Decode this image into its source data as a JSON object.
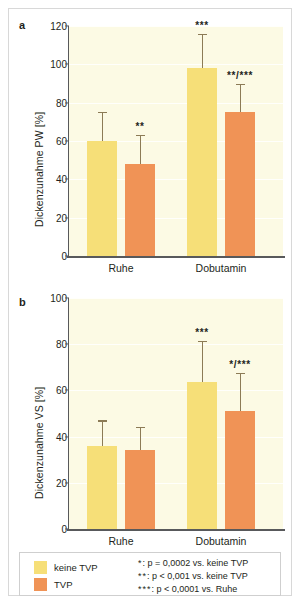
{
  "figure": {
    "panels": [
      {
        "letter": "a",
        "ylabel": "Dickenzunahme PW [%]",
        "yticks": [
          0,
          20,
          40,
          60,
          80,
          100,
          120
        ],
        "ylim": [
          0,
          120
        ],
        "categories": [
          "Ruhe",
          "Dobutamin"
        ]
      },
      {
        "letter": "b",
        "ylabel": "Dickenzunahme VS [%]",
        "yticks": [
          0,
          20,
          40,
          60,
          80,
          100
        ],
        "ylim": [
          0,
          100
        ],
        "categories": [
          "Ruhe",
          "Dobutamin"
        ]
      }
    ]
  },
  "legend": {
    "keys": [
      {
        "label": "keine TVP",
        "color": "#f6df78"
      },
      {
        "label": "TVP",
        "color": "#f09356"
      }
    ],
    "notes": [
      {
        "stars": "*",
        "text": ": p = 0,0002 vs. keine TVP"
      },
      {
        "stars": "**",
        "text": ": p < 0,001 vs. keine TVP"
      },
      {
        "stars": "***",
        "text": ": p < 0,0001 vs. Ruhe"
      }
    ]
  },
  "caption": "",
  "chart_data": [
    {
      "type": "bar",
      "panel": "a",
      "title": "",
      "xlabel": "",
      "ylabel": "Dickenzunahme PW [%]",
      "ylim": [
        0,
        120
      ],
      "yticks": [
        0,
        20,
        40,
        60,
        80,
        100,
        120
      ],
      "grid": true,
      "legend_position": "below",
      "categories": [
        "Ruhe",
        "Dobutamin"
      ],
      "series": [
        {
          "name": "keine TVP",
          "color": "#f6df78",
          "values": [
            60,
            98
          ],
          "errors_upper": [
            15,
            18
          ],
          "annotations": [
            "",
            "***"
          ]
        },
        {
          "name": "TVP",
          "color": "#f09356",
          "values": [
            48,
            75
          ],
          "errors_upper": [
            15,
            15
          ],
          "annotations": [
            "**",
            "**/***"
          ]
        }
      ]
    },
    {
      "type": "bar",
      "panel": "b",
      "title": "",
      "xlabel": "",
      "ylabel": "Dickenzunahme VS [%]",
      "ylim": [
        0,
        100
      ],
      "yticks": [
        0,
        20,
        40,
        60,
        80,
        100
      ],
      "grid": true,
      "legend_position": "below",
      "categories": [
        "Ruhe",
        "Dobutamin"
      ],
      "series": [
        {
          "name": "keine TVP",
          "color": "#f6df78",
          "values": [
            36,
            63.5
          ],
          "errors_upper": [
            11,
            18
          ],
          "annotations": [
            "",
            "***"
          ]
        },
        {
          "name": "TVP",
          "color": "#f09356",
          "values": [
            34,
            51
          ],
          "errors_upper": [
            10,
            16.5
          ],
          "annotations": [
            "",
            "*/***"
          ]
        }
      ]
    }
  ]
}
